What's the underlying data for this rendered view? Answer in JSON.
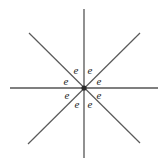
{
  "figure": {
    "background_color": "#ffffff",
    "line_color": "#555555",
    "diagonal_line_color": "#5a5a5a",
    "hub_color": "#2b2b2b",
    "label_color": "#1c1c1c",
    "center": {
      "x": 84,
      "y": 88
    },
    "lines": [
      {
        "name": "horizontal-line",
        "x1": 10,
        "y1": 88,
        "x2": 158,
        "y2": 88
      },
      {
        "name": "vertical-line",
        "x1": 84,
        "y1": 9,
        "x2": 84,
        "y2": 158
      },
      {
        "name": "diagonal-line-nwse",
        "x1": 29,
        "y1": 33,
        "x2": 140,
        "y2": 143
      },
      {
        "name": "diagonal-line-nesw",
        "x1": 140,
        "y1": 33,
        "x2": 28,
        "y2": 144
      }
    ],
    "labels": [
      {
        "name": "electron-label-upper-left-inner",
        "text": "e",
        "x": 76,
        "y": 70
      },
      {
        "name": "electron-label-upper-right-inner",
        "text": "e",
        "x": 90,
        "y": 70
      },
      {
        "name": "electron-label-left-upper",
        "text": "e",
        "x": 66,
        "y": 81
      },
      {
        "name": "electron-label-right-upper",
        "text": "e",
        "x": 99,
        "y": 81
      },
      {
        "name": "electron-label-left-lower",
        "text": "e",
        "x": 67,
        "y": 95
      },
      {
        "name": "electron-label-right-lower",
        "text": "e",
        "x": 99,
        "y": 95
      },
      {
        "name": "electron-label-lower-left-inner",
        "text": "e",
        "x": 77,
        "y": 104
      },
      {
        "name": "electron-label-lower-right-inner",
        "text": "e",
        "x": 90,
        "y": 104
      }
    ]
  }
}
